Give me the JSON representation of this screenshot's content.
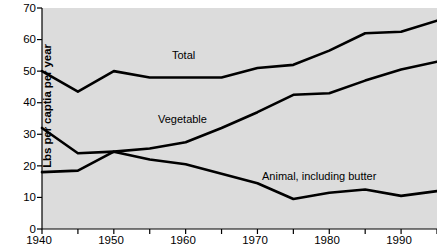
{
  "chart_data": {
    "type": "line",
    "title": "",
    "xlabel": "",
    "ylabel": "Lbs per captia per year",
    "xlim": [
      1940,
      1995
    ],
    "ylim": [
      0,
      70
    ],
    "grid": false,
    "legend_position": "inline-labels",
    "x": [
      1940,
      1945,
      1950,
      1955,
      1960,
      1965,
      1970,
      1975,
      1980,
      1985,
      1990,
      1995
    ],
    "xticks_major": [
      "1940",
      "1950",
      "1960",
      "1970",
      "1980",
      "1990"
    ],
    "xticks_major_values": [
      1940,
      1950,
      1960,
      1970,
      1980,
      1990
    ],
    "xticks_minor_values": [
      1945,
      1955,
      1965,
      1975,
      1985,
      1995
    ],
    "yticks": [
      "0",
      "10",
      "20",
      "30",
      "40",
      "50",
      "60",
      "70"
    ],
    "ytick_values": [
      0,
      10,
      20,
      30,
      40,
      50,
      60,
      70
    ],
    "series": [
      {
        "name": "Total",
        "label": "Total",
        "label_x": 1958.5,
        "label_y": 56.5,
        "color": "#000000",
        "values": [
          50,
          43.5,
          50,
          48,
          48,
          48,
          51,
          52,
          56.5,
          62,
          62.5,
          66
        ]
      },
      {
        "name": "Vegetable",
        "label": "Vegetable",
        "label_x": 1956.0,
        "label_y": 36.0,
        "color": "#000000",
        "values": [
          18,
          18.5,
          24.5,
          25.5,
          27.5,
          32,
          37,
          42.5,
          43,
          47,
          50.5,
          53
        ]
      },
      {
        "name": "Animal, including butter",
        "label": "Animal, including butter",
        "label_x": 1974.0,
        "label_y": 16.5,
        "color": "#000000",
        "values": [
          32,
          24,
          24.5,
          22,
          20.5,
          17.5,
          14.5,
          9.5,
          11.5,
          12.5,
          10.5,
          12
        ]
      }
    ],
    "plot_background": "#dcdcdc",
    "axis_color": "#000000",
    "line_color": "#000000"
  }
}
